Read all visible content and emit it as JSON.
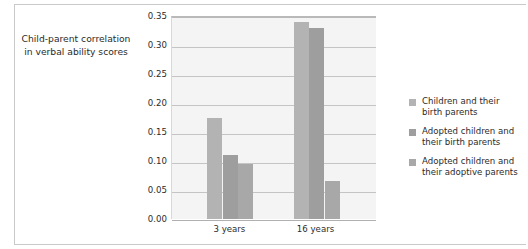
{
  "chart_data": {
    "type": "bar",
    "title": "",
    "subtitle": "",
    "xlabel": "",
    "ylabel": "Child-parent correlation in verbal ability scores",
    "ylabel_lines": [
      "Child-parent correlation",
      "in verbal ability scores"
    ],
    "categories": [
      "3 years",
      "16 years"
    ],
    "series": [
      {
        "name": "Children and their birth parents",
        "name_lines": [
          "Children and their",
          "birth parents"
        ],
        "color": "#b3b3b3",
        "values": [
          0.175,
          0.34
        ]
      },
      {
        "name": "Adopted children and their birth parents",
        "name_lines": [
          "Adopted children and",
          "their birth parents"
        ],
        "color": "#9e9e9e",
        "values": [
          0.11,
          0.33
        ]
      },
      {
        "name": "Adopted children and their adoptive parents",
        "name_lines": [
          "Adopted children and",
          "their adoptive parents"
        ],
        "color": "#a8a8a8",
        "values": [
          0.095,
          0.065
        ]
      }
    ],
    "ylim": [
      0.0,
      0.35
    ],
    "ytick_values": [
      0.0,
      0.05,
      0.1,
      0.15,
      0.2,
      0.25,
      0.3,
      0.35
    ],
    "ytick_labels": [
      "0.00",
      "0.05",
      "0.10",
      "0.15",
      "0.20",
      "0.25",
      "0.30",
      "0.35"
    ],
    "grid": true,
    "grid_axis": "y",
    "legend_position": "right",
    "plot_background": "#f4f4f4",
    "gridline_color": "#c4c4c4",
    "text_color": "#2b2b2b"
  }
}
